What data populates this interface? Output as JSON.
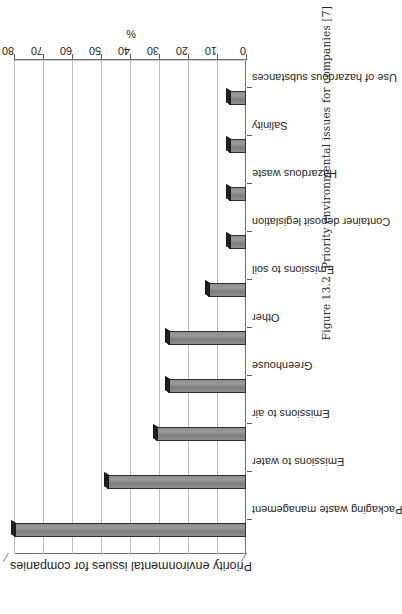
{
  "figure": {
    "caption_number": "Figure 13.2",
    "caption_text": "Priority environmental issues for companies [7]"
  },
  "chart_data": {
    "type": "bar",
    "title": "Priority environmental issues for companies",
    "orientation": "vertical",
    "xlabel": "",
    "ylabel": "%",
    "ylim": [
      0,
      80
    ],
    "yticks": [
      "0",
      "10",
      "20",
      "30",
      "40",
      "50",
      "60",
      "70",
      "80"
    ],
    "grid": true,
    "legend": "none",
    "bar_color": "#8a8a8a",
    "bar_edge_color": "#2e2e2e",
    "categories": [
      "Packaging waste management",
      "Emissions to water",
      "Emissions to air",
      "Greenhouse",
      "Other",
      "Emissions to soil",
      "Container deposit legislation",
      "Hazardous waste",
      "Salinity",
      "Use of hazardous substances"
    ],
    "values": [
      80,
      48,
      31,
      27,
      27,
      13,
      6,
      6,
      6,
      6
    ]
  }
}
